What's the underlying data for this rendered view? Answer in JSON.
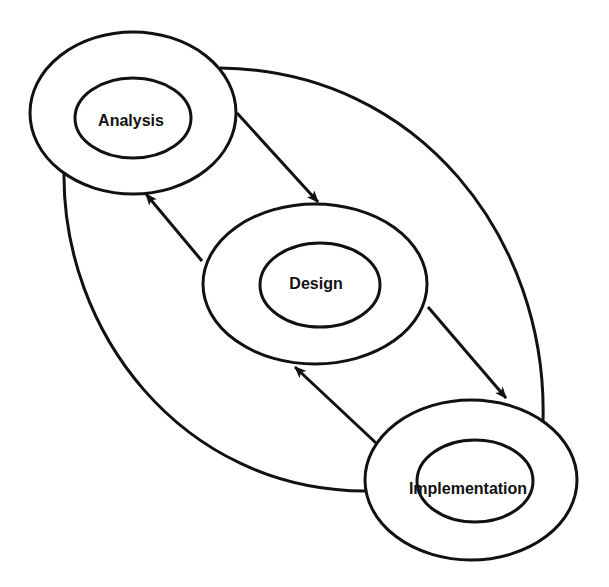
{
  "diagram": {
    "type": "cyclic process diagram",
    "stroke_color": "#111111",
    "background": "#ffffff",
    "nodes": [
      {
        "id": "analysis",
        "label": "Analysis"
      },
      {
        "id": "design",
        "label": "Design"
      },
      {
        "id": "implementation",
        "label": "Implementation"
      }
    ],
    "edges": [
      {
        "from": "analysis",
        "to": "design",
        "style": "arrow"
      },
      {
        "from": "design",
        "to": "analysis",
        "style": "arrow"
      },
      {
        "from": "design",
        "to": "implementation",
        "style": "arrow"
      },
      {
        "from": "implementation",
        "to": "design",
        "style": "arrow"
      },
      {
        "from": "analysis",
        "to": "implementation",
        "style": "curve-right"
      },
      {
        "from": "analysis",
        "to": "implementation",
        "style": "curve-left"
      }
    ]
  }
}
